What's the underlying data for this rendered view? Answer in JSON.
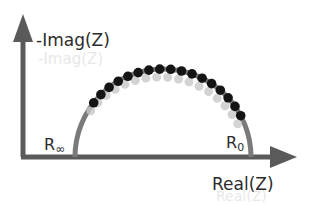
{
  "diagram": {
    "axes": {
      "y_label": "-Imag(Z)",
      "x_label": "Real(Z)"
    },
    "markers": {
      "r_infinity": {
        "base": "R",
        "sub": "∞"
      },
      "r_zero": {
        "base": "R",
        "sub": "0"
      }
    },
    "colors": {
      "axis": "#5a5a5a",
      "arc": "#7a7a7a",
      "data_points": "#141414",
      "ghost_points": "#c8c8c8"
    },
    "data_points_count": 17,
    "data_points_arc_range_deg": [
      142,
      28
    ]
  }
}
